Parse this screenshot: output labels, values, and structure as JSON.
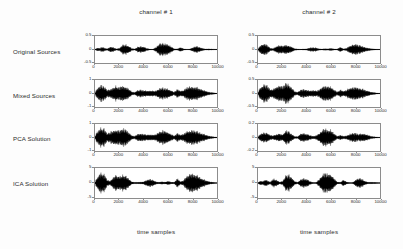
{
  "figure": {
    "columns": [
      {
        "title": "channel # 1",
        "xlabel": "time samples"
      },
      {
        "title": "channel # 2",
        "xlabel": "time samples"
      }
    ],
    "rows": [
      {
        "label": "Original Sources"
      },
      {
        "label": "Mixed Sources"
      },
      {
        "label": "PCA Solution"
      },
      {
        "label": "ICA Solution"
      }
    ],
    "xticks": [
      "0",
      "2000",
      "4000",
      "6000",
      "8000",
      "10000"
    ],
    "colors": {
      "waveform": "#000000",
      "axis_frame": "#8c8c8c",
      "text": "#2b2b2b",
      "background": "#fdfdfd",
      "plot_background": "#ffffff"
    }
  },
  "chart_data": {
    "type": "line",
    "title": "",
    "xlabel": "time samples",
    "ylabel": "",
    "grid": false,
    "legend": "none",
    "xlim": [
      0,
      10000
    ],
    "xticks": [
      0,
      2000,
      4000,
      6000,
      8000,
      10000
    ],
    "panels": [
      {
        "row": "Original Sources",
        "column": "channel # 1",
        "ylim": [
          -0.5,
          0.5
        ],
        "yticks": [
          0.5,
          0,
          -0.5
        ],
        "description": "speech waveform, small bursts then a large burst near 5500-6500 samples",
        "envelope_x": [
          0,
          200,
          400,
          620,
          820,
          1000,
          1250,
          1500,
          1750,
          2000,
          2250,
          2500,
          2750,
          3000,
          3250,
          3500,
          3750,
          4000,
          4250,
          4500,
          4750,
          5000,
          5250,
          5500,
          5750,
          6000,
          6250,
          6500,
          6750,
          7000,
          7250,
          7500,
          7750,
          8000,
          8250,
          8500,
          8750,
          9000,
          9250,
          9500,
          9750,
          10000
        ],
        "envelope_y": [
          0.02,
          0.14,
          0.1,
          0.2,
          0.12,
          0.05,
          0.22,
          0.18,
          0.06,
          0.1,
          0.36,
          0.4,
          0.3,
          0.1,
          0.05,
          0.2,
          0.26,
          0.22,
          0.1,
          0.04,
          0.03,
          0.18,
          0.42,
          0.48,
          0.46,
          0.4,
          0.24,
          0.06,
          0.05,
          0.18,
          0.07,
          0.03,
          0.03,
          0.16,
          0.26,
          0.22,
          0.12,
          0.05,
          0.06,
          0.05,
          0.03,
          0.02
        ]
      },
      {
        "row": "Original Sources",
        "column": "channel # 2",
        "ylim": [
          -0.5,
          0.5
        ],
        "yticks": [
          0.5,
          0,
          -0.5
        ],
        "description": "speech waveform, large burst at start, burst near 2000-3000, large burst near 7500-8500",
        "envelope_x": [
          0,
          200,
          400,
          620,
          820,
          1000,
          1250,
          1500,
          1750,
          2000,
          2250,
          2500,
          2750,
          3000,
          3250,
          3500,
          3750,
          4000,
          4250,
          4500,
          4750,
          5000,
          5250,
          5500,
          5750,
          6000,
          6250,
          6500,
          6750,
          7000,
          7250,
          7500,
          7750,
          8000,
          8250,
          8500,
          8750,
          9000,
          9250,
          9500,
          9750,
          10000
        ],
        "envelope_y": [
          0.05,
          0.34,
          0.46,
          0.44,
          0.3,
          0.12,
          0.08,
          0.26,
          0.34,
          0.3,
          0.36,
          0.34,
          0.22,
          0.08,
          0.04,
          0.04,
          0.05,
          0.06,
          0.14,
          0.18,
          0.14,
          0.06,
          0.04,
          0.08,
          0.06,
          0.1,
          0.05,
          0.04,
          0.22,
          0.06,
          0.1,
          0.3,
          0.38,
          0.42,
          0.36,
          0.28,
          0.2,
          0.14,
          0.08,
          0.05,
          0.03,
          0.02
        ]
      },
      {
        "row": "Mixed Sources",
        "column": "channel # 1",
        "ylim": [
          -1,
          1
        ],
        "yticks": [
          1,
          0,
          -1
        ],
        "description": "mixture of both sources, dense activity across the record",
        "envelope_x": [
          0,
          200,
          400,
          620,
          820,
          1000,
          1250,
          1500,
          1750,
          2000,
          2250,
          2500,
          2750,
          3000,
          3250,
          3500,
          3750,
          4000,
          4250,
          4500,
          4750,
          5000,
          5250,
          5500,
          5750,
          6000,
          6250,
          6500,
          6750,
          7000,
          7250,
          7500,
          7750,
          8000,
          8250,
          8500,
          8750,
          9000,
          9250,
          9500,
          9750,
          10000
        ],
        "envelope_y": [
          0.06,
          0.46,
          0.62,
          0.66,
          0.52,
          0.3,
          0.34,
          0.5,
          0.58,
          0.52,
          0.6,
          0.58,
          0.4,
          0.16,
          0.1,
          0.26,
          0.3,
          0.26,
          0.22,
          0.24,
          0.2,
          0.24,
          0.4,
          0.46,
          0.42,
          0.38,
          0.26,
          0.12,
          0.38,
          0.22,
          0.28,
          0.48,
          0.56,
          0.6,
          0.52,
          0.44,
          0.34,
          0.24,
          0.16,
          0.1,
          0.06,
          0.03
        ]
      },
      {
        "row": "Mixed Sources",
        "column": "channel # 2",
        "ylim": [
          -0.5,
          0.5
        ],
        "yticks": [
          0.5,
          0,
          -0.5
        ],
        "description": "second mixture, dense activity with peaks near 600, 2600 and 5800",
        "envelope_x": [
          0,
          200,
          400,
          620,
          820,
          1000,
          1250,
          1500,
          1750,
          2000,
          2250,
          2500,
          2750,
          3000,
          3250,
          3500,
          3750,
          4000,
          4250,
          4500,
          4750,
          5000,
          5250,
          5500,
          5750,
          6000,
          6250,
          6500,
          6750,
          7000,
          7250,
          7500,
          7750,
          8000,
          8250,
          8500,
          8750,
          9000,
          9250,
          9500,
          9750,
          10000
        ],
        "envelope_y": [
          0.08,
          0.52,
          0.72,
          0.74,
          0.6,
          0.34,
          0.38,
          0.56,
          0.64,
          0.58,
          0.86,
          0.8,
          0.48,
          0.18,
          0.12,
          0.3,
          0.34,
          0.3,
          0.24,
          0.26,
          0.22,
          0.3,
          0.56,
          0.66,
          0.62,
          0.5,
          0.3,
          0.14,
          0.3,
          0.2,
          0.28,
          0.44,
          0.5,
          0.54,
          0.48,
          0.4,
          0.3,
          0.22,
          0.14,
          0.09,
          0.05,
          0.03
        ]
      },
      {
        "row": "PCA Solution",
        "column": "channel # 1",
        "ylim": [
          -1,
          1
        ],
        "yticks": [
          1,
          0,
          -1
        ],
        "description": "first principal component, still a mixture of both sources",
        "envelope_x": [
          0,
          200,
          400,
          620,
          820,
          1000,
          1250,
          1500,
          1750,
          2000,
          2250,
          2500,
          2750,
          3000,
          3250,
          3500,
          3750,
          4000,
          4250,
          4500,
          4750,
          5000,
          5250,
          5500,
          5750,
          6000,
          6250,
          6500,
          6750,
          7000,
          7250,
          7500,
          7750,
          8000,
          8250,
          8500,
          8750,
          9000,
          9250,
          9500,
          9750,
          10000
        ],
        "envelope_y": [
          0.08,
          0.54,
          0.74,
          0.78,
          0.62,
          0.34,
          0.4,
          0.58,
          0.66,
          0.58,
          0.72,
          0.7,
          0.44,
          0.18,
          0.12,
          0.28,
          0.32,
          0.28,
          0.22,
          0.26,
          0.22,
          0.28,
          0.48,
          0.56,
          0.52,
          0.42,
          0.28,
          0.14,
          0.36,
          0.22,
          0.3,
          0.5,
          0.58,
          0.62,
          0.54,
          0.44,
          0.34,
          0.24,
          0.16,
          0.1,
          0.06,
          0.03
        ]
      },
      {
        "row": "PCA Solution",
        "column": "channel # 2",
        "ylim": [
          -0.2,
          0.2
        ],
        "yticks": [
          0.2,
          0,
          -0.2
        ],
        "description": "second principal component, lower amplitude residual mixture",
        "envelope_x": [
          0,
          200,
          400,
          620,
          820,
          1000,
          1250,
          1500,
          1750,
          2000,
          2250,
          2500,
          2750,
          3000,
          3250,
          3500,
          3750,
          4000,
          4250,
          4500,
          4750,
          5000,
          5250,
          5500,
          5750,
          6000,
          6250,
          6500,
          6750,
          7000,
          7250,
          7500,
          7750,
          8000,
          8250,
          8500,
          8750,
          9000,
          9250,
          9500,
          9750,
          10000
        ],
        "envelope_y": [
          0.05,
          0.3,
          0.4,
          0.42,
          0.34,
          0.18,
          0.16,
          0.26,
          0.32,
          0.26,
          0.56,
          0.5,
          0.28,
          0.1,
          0.08,
          0.3,
          0.34,
          0.3,
          0.18,
          0.12,
          0.14,
          0.34,
          0.62,
          0.7,
          0.66,
          0.56,
          0.34,
          0.1,
          0.2,
          0.12,
          0.14,
          0.28,
          0.34,
          0.36,
          0.3,
          0.34,
          0.3,
          0.2,
          0.12,
          0.07,
          0.04,
          0.02
        ]
      },
      {
        "row": "ICA Solution",
        "column": "channel # 1",
        "ylim": [
          -5,
          5
        ],
        "yticks": [
          5,
          0,
          -5
        ],
        "description": "recovered source resembling original channel 2",
        "envelope_x": [
          0,
          200,
          400,
          620,
          820,
          1000,
          1250,
          1500,
          1750,
          2000,
          2250,
          2500,
          2750,
          3000,
          3250,
          3500,
          3750,
          4000,
          4250,
          4500,
          4750,
          5000,
          5250,
          5500,
          5750,
          6000,
          6250,
          6500,
          6750,
          7000,
          7250,
          7500,
          7750,
          8000,
          8250,
          8500,
          8750,
          9000,
          9250,
          9500,
          9750,
          10000
        ],
        "envelope_y": [
          0.06,
          0.46,
          0.7,
          0.74,
          0.54,
          0.22,
          0.16,
          0.44,
          0.56,
          0.5,
          0.58,
          0.56,
          0.34,
          0.1,
          0.06,
          0.06,
          0.08,
          0.1,
          0.22,
          0.28,
          0.22,
          0.1,
          0.06,
          0.1,
          0.08,
          0.14,
          0.07,
          0.06,
          0.34,
          0.1,
          0.18,
          0.5,
          0.64,
          0.7,
          0.6,
          0.48,
          0.34,
          0.22,
          0.14,
          0.08,
          0.05,
          0.02
        ]
      },
      {
        "row": "ICA Solution",
        "column": "channel # 2",
        "ylim": [
          -5,
          5
        ],
        "yticks": [
          5,
          0,
          -5
        ],
        "description": "recovered source resembling original channel 1",
        "envelope_x": [
          0,
          200,
          400,
          620,
          820,
          1000,
          1250,
          1500,
          1750,
          2000,
          2250,
          2500,
          2750,
          3000,
          3250,
          3500,
          3750,
          4000,
          4250,
          4500,
          4750,
          5000,
          5250,
          5500,
          5750,
          6000,
          6250,
          6500,
          6750,
          7000,
          7250,
          7500,
          7750,
          8000,
          8250,
          8500,
          8750,
          9000,
          9250,
          9500,
          9750,
          10000
        ],
        "envelope_y": [
          0.03,
          0.16,
          0.12,
          0.26,
          0.16,
          0.06,
          0.3,
          0.24,
          0.08,
          0.12,
          0.52,
          0.58,
          0.42,
          0.12,
          0.06,
          0.26,
          0.34,
          0.28,
          0.12,
          0.05,
          0.04,
          0.26,
          0.62,
          0.74,
          0.7,
          0.6,
          0.34,
          0.08,
          0.06,
          0.24,
          0.09,
          0.04,
          0.04,
          0.22,
          0.36,
          0.3,
          0.16,
          0.06,
          0.07,
          0.06,
          0.04,
          0.02
        ]
      }
    ]
  }
}
